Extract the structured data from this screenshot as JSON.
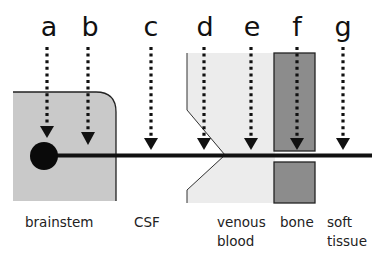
{
  "diagram": {
    "probe_letters": [
      "a",
      "b",
      "c",
      "d",
      "e",
      "f",
      "g"
    ],
    "regions": [
      {
        "name": "brainstem",
        "label_lines": [
          "brainstem"
        ]
      },
      {
        "name": "csf",
        "label_lines": [
          "CSF"
        ]
      },
      {
        "name": "venous-blood",
        "label_lines": [
          "venous",
          "blood"
        ]
      },
      {
        "name": "bone",
        "label_lines": [
          "bone"
        ]
      },
      {
        "name": "soft-tissue",
        "label_lines": [
          "soft",
          "tissue"
        ]
      }
    ],
    "colors": {
      "brainstem_fill": "#c9c9c9",
      "venous_fill": "#ececec",
      "bone_fill": "#8c8c8c",
      "line": "#111111"
    }
  }
}
